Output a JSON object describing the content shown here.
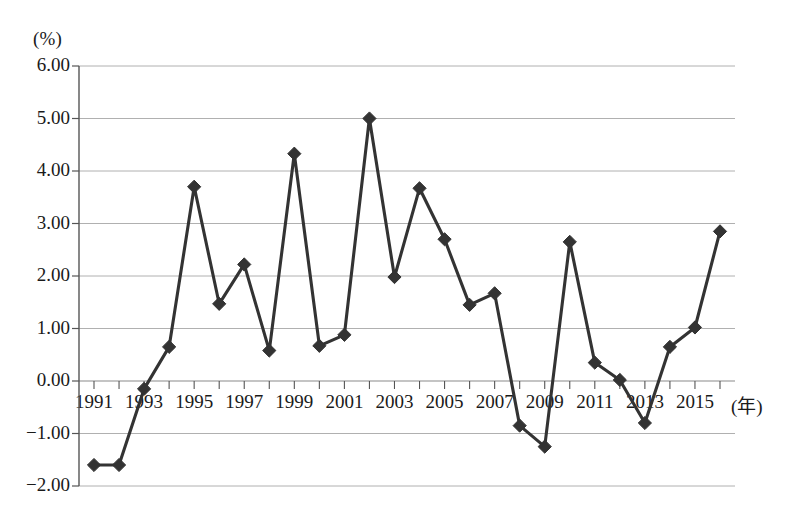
{
  "chart_data": {
    "type": "line",
    "title": "",
    "subtitle": "",
    "xlabel": "年",
    "ylabel": "(%)",
    "y_unit_label": "(%)",
    "x_unit_label": "(年)",
    "grid": true,
    "legend": null,
    "xlim": [
      1990.5,
      2016.5
    ],
    "ylim": [
      -2.0,
      6.0
    ],
    "yticks": [
      6.0,
      5.0,
      4.0,
      3.0,
      2.0,
      1.0,
      0.0,
      -1.0,
      -2.0
    ],
    "ytick_labels": [
      "6.00",
      "5.00",
      "4.00",
      "3.00",
      "2.00",
      "1.00",
      "0.00",
      "-1.00",
      "-2.00"
    ],
    "xticks": [
      1991,
      1993,
      1995,
      1997,
      1999,
      2001,
      2003,
      2005,
      2007,
      2009,
      2011,
      2013,
      2015
    ],
    "xtick_labels": [
      "1991",
      "1993",
      "1995",
      "1997",
      "1999",
      "2001",
      "2003",
      "2005",
      "2007",
      "2009",
      "2011",
      "2013",
      "2015"
    ],
    "x": [
      1991,
      1992,
      1993,
      1994,
      1995,
      1996,
      1997,
      1998,
      1999,
      2000,
      2001,
      2002,
      2003,
      2004,
      2005,
      2006,
      2007,
      2008,
      2009,
      2010,
      2011,
      2012,
      2013,
      2014,
      2015,
      2016
    ],
    "values": [
      -1.6,
      -1.6,
      -0.15,
      0.65,
      3.7,
      1.47,
      2.22,
      0.58,
      4.33,
      0.67,
      0.88,
      5.0,
      1.98,
      3.67,
      2.7,
      1.45,
      1.67,
      -0.85,
      -1.25,
      2.65,
      0.35,
      0.02,
      -0.8,
      0.65,
      1.02,
      2.85
    ],
    "marker": "diamond",
    "line_color": "#333333",
    "marker_color": "#333333",
    "grid_color": "#b0b0b0",
    "axis_color": "#555555",
    "background": "#ffffff"
  }
}
